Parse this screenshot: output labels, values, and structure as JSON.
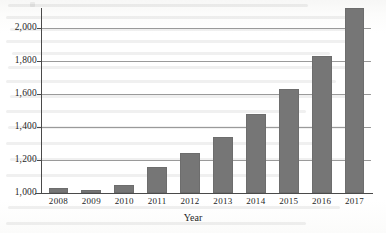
{
  "chart_data": {
    "type": "bar",
    "title": "",
    "xlabel": "Year",
    "ylabel": "",
    "categories": [
      "2008",
      "2009",
      "2010",
      "2011",
      "2012",
      "2013",
      "2014",
      "2015",
      "2016",
      "2017"
    ],
    "values": [
      1030,
      1018,
      1050,
      1158,
      1242,
      1340,
      1480,
      1630,
      1830,
      2120
    ],
    "ylim": [
      1000,
      2120
    ],
    "y_ticks": [
      1000,
      1200,
      1400,
      1600,
      1800,
      2000
    ],
    "y_tick_labels": [
      "1,000",
      "1,200",
      "1,400",
      "1,600",
      "1,800",
      "2,000"
    ],
    "grid": true,
    "legend": false,
    "bar_color": "#767676",
    "axis_color": "#4a4a4a",
    "gridline_color": "#9a9a9a"
  },
  "axes": {
    "x_axis_title": "Year",
    "y_axis_title": ""
  }
}
